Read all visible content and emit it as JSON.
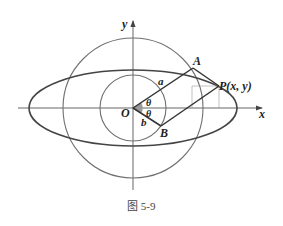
{
  "diagram": {
    "labels": {
      "y_axis": "y",
      "x_axis": "x",
      "origin": "O",
      "point_a": "A",
      "point_b": "B",
      "point_p": "P(x, y)",
      "segment_a": "a",
      "segment_b": "b",
      "angle_upper": "θ",
      "angle_lower": "θ"
    },
    "caption": "图 5-9",
    "colors": {
      "curves": "#6b6b6b",
      "ellipse": "#444444",
      "lines": "#333333",
      "axes": "#555555"
    }
  }
}
